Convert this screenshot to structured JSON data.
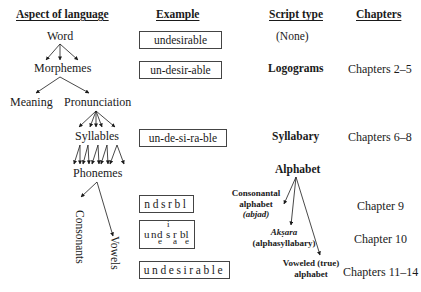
{
  "headers": {
    "aspect": "Aspect of language",
    "example": "Example",
    "script_type": "Script type",
    "chapters": "Chapters"
  },
  "hierarchy": {
    "word": "Word",
    "morphemes": "Morphemes",
    "meaning": "Meaning",
    "pronunciation": "Pronunciation",
    "syllables": "Syllables",
    "phonemes": "Phonemes",
    "consonants": "Consonants",
    "vowels": "Vowels"
  },
  "examples": {
    "word": "undesirable",
    "morphemes": "un-desir-able",
    "syllables": "un-de-si-ra-ble",
    "consonantal": "ndsrbl",
    "aksara": {
      "base": [
        "u",
        "n",
        "d",
        "s",
        "r",
        "bl"
      ],
      "above": [
        "i"
      ],
      "below": [
        "e",
        "a",
        "e"
      ]
    },
    "alphabetic": "undesirable"
  },
  "script_types": {
    "none": "(None)",
    "logograms": "Logograms",
    "syllabary": "Syllabary",
    "alphabet": "Alphabet",
    "consonantal": {
      "line1": "Consonantal",
      "line2": "alphabet",
      "line3": "(abjad)"
    },
    "aksara": {
      "line1": "Akṣara",
      "line2": "(alphasyllabary)"
    },
    "voweled": {
      "line1": "Voweled (true)",
      "line2": "alphabet"
    }
  },
  "chapters": {
    "logograms": "Chapters 2–5",
    "syllabary": "Chapters 6–8",
    "abjad": "Chapter 9",
    "aksara": "Chapter 10",
    "voweled": "Chapters 11–14"
  }
}
